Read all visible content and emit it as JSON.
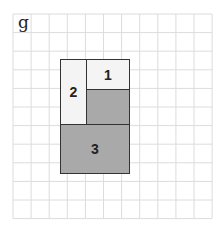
{
  "panel": {
    "label": "g"
  },
  "grid": {
    "x0": 13,
    "y0": 14,
    "cols": 11,
    "rows": 11,
    "cell_w": 18.1,
    "cell_h": 18.6,
    "line_color": "#dcdcdc"
  },
  "colors": {
    "light": "#f4f4f4",
    "shaded": "#a9a9a9",
    "border": "#333333"
  },
  "pieces": [
    {
      "id": "1",
      "label": "1",
      "fill": "light",
      "x": 86,
      "y": 59,
      "w": 44,
      "h": 31
    },
    {
      "id": "1-shaded",
      "label": "",
      "fill": "shaded",
      "x": 86,
      "y": 89,
      "w": 44,
      "h": 36
    },
    {
      "id": "2",
      "label": "2",
      "fill": "light",
      "x": 60,
      "y": 59,
      "w": 27,
      "h": 66
    },
    {
      "id": "3",
      "label": "3",
      "fill": "shaded",
      "x": 60,
      "y": 124,
      "w": 70,
      "h": 50
    }
  ]
}
